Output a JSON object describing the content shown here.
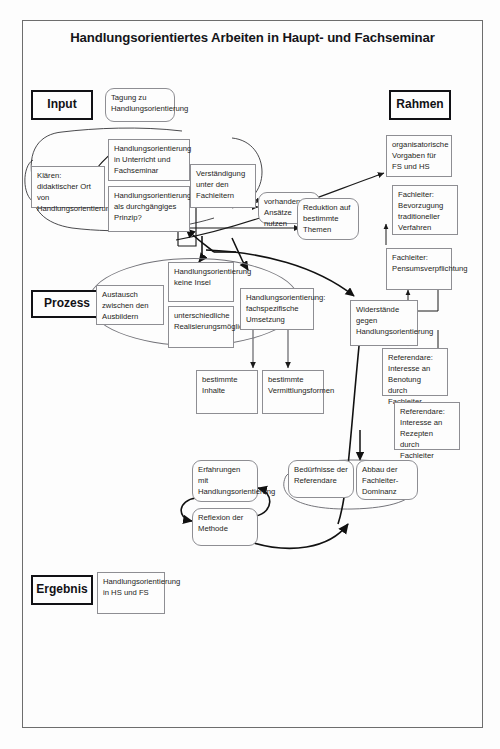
{
  "page": {
    "title": "Handlungsorientiertes Arbeiten in Haupt- und Fachseminar",
    "frame_color": "#6d6d6d",
    "box_border_color": "#8e8e93",
    "stage_border_color": "#111115",
    "edge_color": "#1a1a1a",
    "background": "#fdfdfd"
  },
  "stages": [
    {
      "id": "input",
      "label": "Input"
    },
    {
      "id": "rahmen",
      "label": "Rahmen"
    },
    {
      "id": "prozess",
      "label": "Prozess"
    },
    {
      "id": "ergebnis",
      "label": "Ergebnis"
    }
  ],
  "nodes": [
    {
      "id": "tagung",
      "text": "Tagung zu Handlungsorientierung"
    },
    {
      "id": "klaeren",
      "text": "Klären: didaktischer Ort von Handlungsorientierung"
    },
    {
      "id": "ho_unterricht",
      "text": "Handlungsorientierung in Unterricht und Fachseminar"
    },
    {
      "id": "ho_prinzip",
      "text": "Handlungsorientierung als durchgängiges Prinzip?"
    },
    {
      "id": "verstaendigung",
      "text": "Verständigung unter den Fachleitern"
    },
    {
      "id": "vorhandene",
      "text": "vorhandene Ansätze nutzen"
    },
    {
      "id": "reduktion",
      "text": "Reduktion auf bestimmte Themen"
    },
    {
      "id": "organisator",
      "text": "organisatorische Vorgaben für FS und HS"
    },
    {
      "id": "fl_bevorzugung",
      "text": "Fachleiter: Bevorzugung traditioneller Verfahren"
    },
    {
      "id": "fl_pensum",
      "text": "Fachleiter: Pensumsverpflichtung"
    },
    {
      "id": "austausch",
      "text": "Austausch zwischen den Ausbildern"
    },
    {
      "id": "keine_insel",
      "text": "Handlungsorientierung keine Insel"
    },
    {
      "id": "unterschiedlich",
      "text": "unterschiedliche Realisierungsmöglichkeiten"
    },
    {
      "id": "fachspezifisch",
      "text": "Handlungsorientierung: fachspezifische Umsetzung"
    },
    {
      "id": "widerstaende",
      "text": "Widerstände gegen Handlungsorientierung"
    },
    {
      "id": "ref_benotung",
      "text": "Referendare: Interesse an Benotung durch Fachleiter"
    },
    {
      "id": "ref_rezepte",
      "text": "Referendare: Interesse an Rezepten durch Fachleiter"
    },
    {
      "id": "best_inhalte",
      "text": "bestimmte Inhalte"
    },
    {
      "id": "best_vermittlung",
      "text": "bestimmte Vermittlungsformen"
    },
    {
      "id": "erfahrungen",
      "text": "Erfahrungen mit Handlungsorientierung"
    },
    {
      "id": "reflexion",
      "text": "Reflexion der Methode"
    },
    {
      "id": "beduerfnisse",
      "text": "Bedürfnisse der Referendare"
    },
    {
      "id": "abbau",
      "text": "Abbau der Fachleiter-Dominanz"
    },
    {
      "id": "ergebnis_ho",
      "text": "Handlungsorientierung in HS und FS"
    }
  ]
}
